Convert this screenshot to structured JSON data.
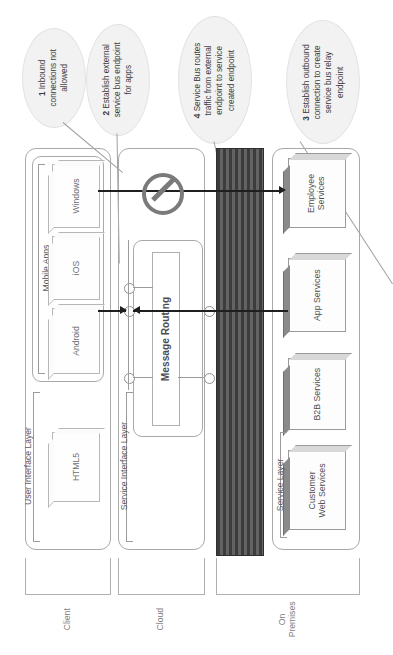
{
  "diagram": {
    "orientation": "rotated-90-ccw"
  },
  "callouts": [
    {
      "id": "callout-1",
      "number": "1",
      "text": "Inbound connections not allowed",
      "lines": [
        "1 Inbound",
        "connections not",
        "allowed"
      ]
    },
    {
      "id": "callout-2",
      "number": "2",
      "text": "Establish external service bus endpoint for apps",
      "lines": [
        "2 Establish external",
        "service bus endpoint",
        "for apps"
      ]
    },
    {
      "id": "callout-4",
      "number": "4",
      "text": "Service Bus routes traffic from external endpoint to service created endpoint",
      "lines": [
        "4 Service Bus routes",
        "traffic from external",
        "endpoint to service",
        "created endpoint"
      ]
    },
    {
      "id": "callout-3",
      "number": "3",
      "text": "Establish outbound connection to create service bus relay endpoint",
      "lines": [
        "3 Establish outbound",
        "connection to create",
        "service bus relay",
        "endpoint"
      ]
    }
  ],
  "zones": [
    {
      "id": "zone-client",
      "label": "Client"
    },
    {
      "id": "zone-cloud",
      "label": "Cloud"
    },
    {
      "id": "zone-onpremises",
      "label": "On\nPremises"
    }
  ],
  "layers": [
    {
      "id": "layer-ui",
      "label": "User Interface Layer"
    },
    {
      "id": "layer-service-interface",
      "label": "Service Interface Layer"
    },
    {
      "id": "layer-service",
      "label": "Service Layer"
    }
  ],
  "client": {
    "mobile_apps_label": "Mobile Apps",
    "mobile_apps": [
      {
        "id": "app-windows",
        "label": "Windows"
      },
      {
        "id": "app-ios",
        "label": "iOS"
      },
      {
        "id": "app-android",
        "label": "Android"
      }
    ],
    "web": [
      {
        "id": "app-html5",
        "label": "HTML5"
      }
    ]
  },
  "cloud": {
    "message_routing_label": "Message Routing"
  },
  "onpremises": {
    "services": [
      {
        "id": "svc-employee",
        "label": "Employee\nServices"
      },
      {
        "id": "svc-app",
        "label": "App Services"
      },
      {
        "id": "svc-b2b",
        "label": "B2B Services"
      },
      {
        "id": "svc-customer-web",
        "label": "Customer\nWeb Services"
      }
    ]
  },
  "symbols": {
    "firewall": "firewall-band",
    "blocked": "no-entry-icon"
  },
  "colors": {
    "bubble_fill": "#f2f2f2",
    "firewall_dark": "#3c3c3c",
    "firewall_light": "#636363",
    "noentry_gray": "#7a7a7a",
    "arrow_black": "#1f1f1f",
    "box_outline": "#b7b7b7",
    "service_top_edge": "#8a8a8a",
    "text_gray": "#58595b"
  }
}
